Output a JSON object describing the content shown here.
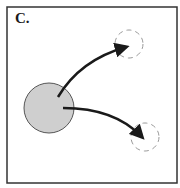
{
  "panel": {
    "label": "C.",
    "colors": {
      "border": "#333333",
      "circle_fill": "#cfcfcf",
      "circle_stroke": "#555555",
      "arrow": "#1a1a1a",
      "dashed": "#9a9a9a"
    },
    "source_circle": {
      "cx": 49,
      "cy": 108,
      "r": 25
    },
    "targets": [
      {
        "name": "upper-target",
        "cx": 129,
        "cy": 44,
        "r": 14
      },
      {
        "name": "lower-target",
        "cx": 145,
        "cy": 137,
        "r": 14
      }
    ],
    "arrows": [
      {
        "name": "arrow-to-upper",
        "from": [
          58,
          97
        ],
        "to": [
          127,
          47
        ]
      },
      {
        "name": "arrow-to-lower",
        "from": [
          63,
          108
        ],
        "to": [
          143,
          138
        ]
      }
    ]
  }
}
